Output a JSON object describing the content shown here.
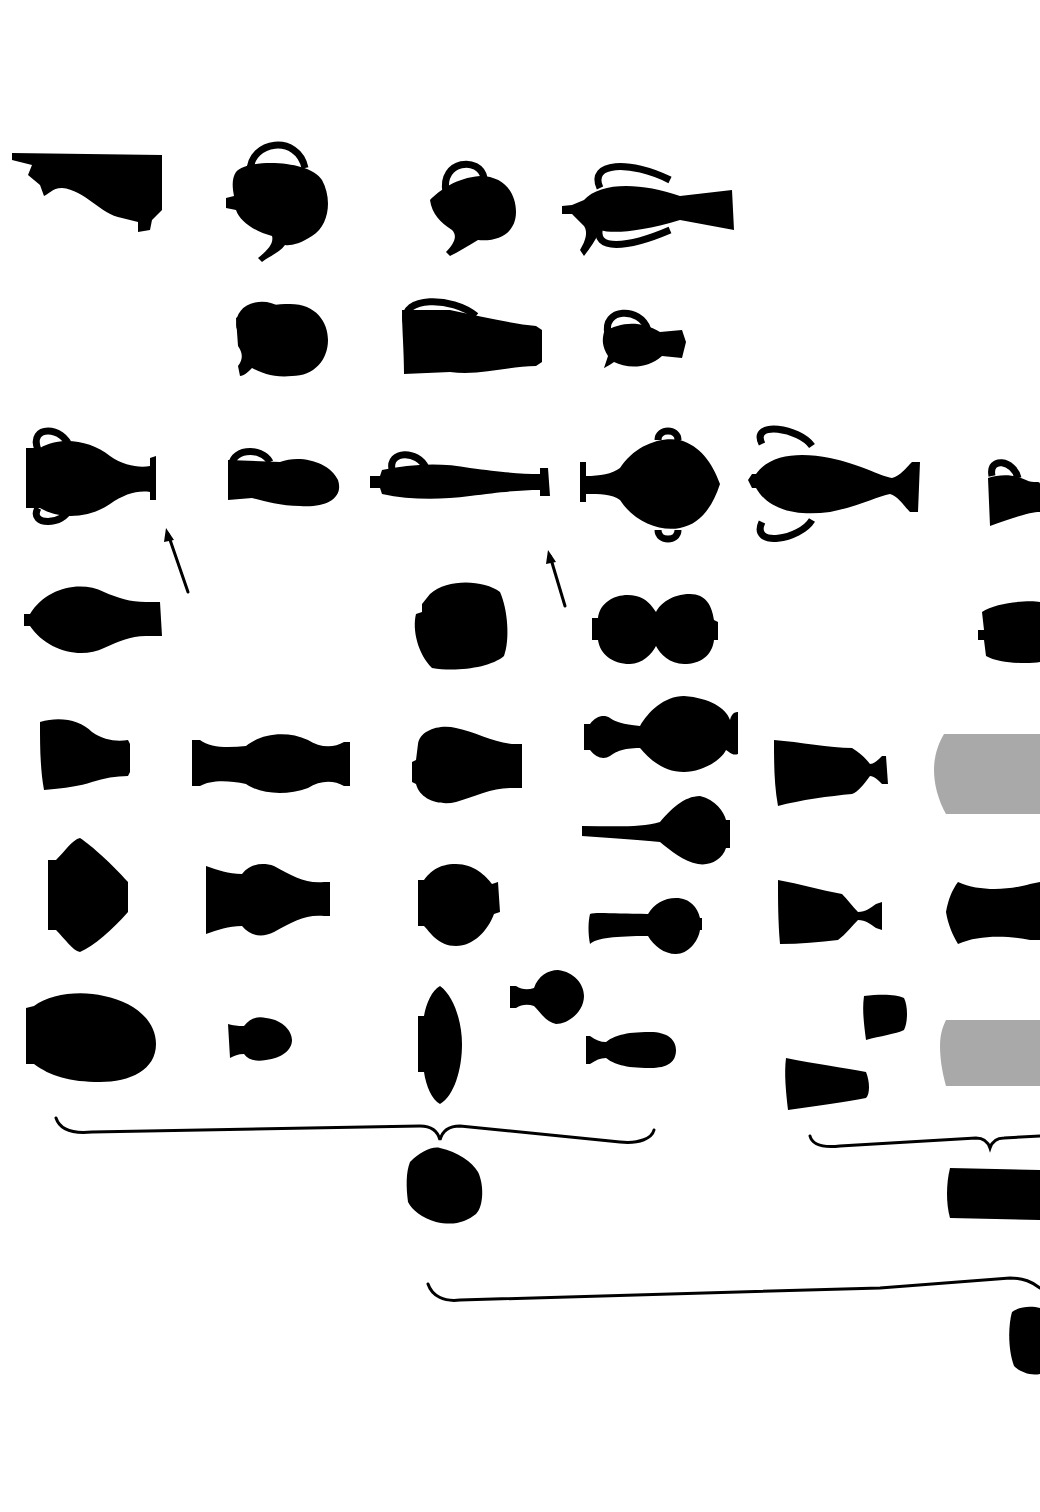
{
  "figure": {
    "kind": "vessel-silhouette typology plate",
    "background": "#ffffff",
    "ink_color": "#000000",
    "placeholder_color": "#a9a9a9",
    "rows": [
      {
        "row": 1,
        "items": [
          "ewer-spout-fragment-icon",
          "teapot-icon",
          "spouted-jug-icon",
          "two-handled-spouted-ewer-icon"
        ]
      },
      {
        "row": 2,
        "items": [
          "round-jug-icon",
          "long-jug-icon",
          "small-jug-icon"
        ]
      },
      {
        "row": 3,
        "items": [
          "amphora-icon",
          "jug-icon",
          "slender-flask-icon",
          "lidded-two-handled-jar-icon",
          "two-handled-amphora-icon",
          "small-cup-icon"
        ]
      },
      {
        "row": 4,
        "items": [
          "ovoid-bottle-icon",
          "round-jar-icon",
          "double-gourd-icon",
          "cut-off-jar-icon"
        ]
      },
      {
        "row": 5,
        "items": [
          "short-vase-icon",
          "baluster-vase-icon",
          "pear-vase-icon",
          "long-neck-bottle-icon",
          "footed-beaker-icon",
          "grey-placeholder-icon"
        ]
      },
      {
        "row": 6,
        "items": [
          "carinated-jar-icon",
          "vase-icon",
          "globular-vase-icon",
          "spindle-bottle-icon",
          "goblet-icon",
          "concave-jar-icon"
        ]
      },
      {
        "row": 7,
        "items": [
          "ovoid-jar-icon",
          "small-squat-jar-icon",
          "lenticular-jar-icon",
          "small-flask-icon",
          "alabastron-icon",
          "small-beaker-icon",
          "conical-beaker-icon",
          "grey-placeholder-icon"
        ]
      },
      {
        "row": 8,
        "items": [
          "rounded-jar-icon",
          "cylindrical-jar-icon"
        ]
      },
      {
        "row": 9,
        "items": [
          "oval-jar-icon"
        ]
      }
    ],
    "annotations": {
      "arrows": 2,
      "braces": 3
    }
  }
}
